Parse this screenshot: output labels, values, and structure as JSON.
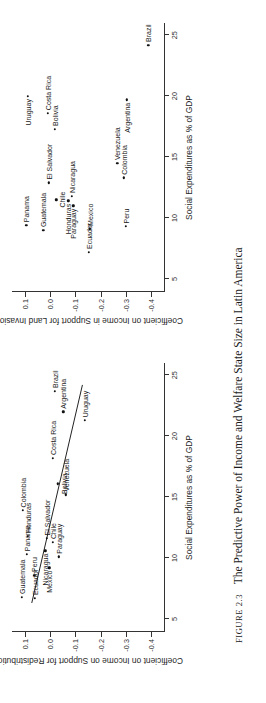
{
  "figure": {
    "number_label": "FIGURE 2.3",
    "caption": "The Predictive Power of Income and Welfare State Size in Latin America"
  },
  "chart_data": [
    {
      "type": "scatter",
      "panel": "left",
      "title": "",
      "xlabel": "Social Expenditures as % of GDP",
      "ylabel": "Coefficient on Income on Support for Redistribution",
      "xlim": [
        4,
        26
      ],
      "ylim": [
        -0.45,
        0.15
      ],
      "xticks": [
        "5",
        "10",
        "15",
        "20",
        "25"
      ],
      "xtick_values": [
        5,
        10,
        15,
        20,
        25
      ],
      "yticks": [
        "0.1",
        "0.0",
        "-0.1",
        "-0.2",
        "-0.3",
        "-0.4"
      ],
      "ytick_values": [
        0.1,
        0.0,
        -0.1,
        -0.2,
        -0.3,
        -0.4
      ],
      "grid": false,
      "legend": "none",
      "has_fit_line": true,
      "fit_line": {
        "x0": 6.3,
        "y0": 0.072,
        "x1": 24.2,
        "y1": -0.128
      },
      "points": [
        {
          "label": "Guatemala",
          "x": 6.8,
          "y": 0.112,
          "side": "lr"
        },
        {
          "label": "Colombia",
          "x": 13.9,
          "y": 0.108,
          "side": "lr"
        },
        {
          "label": "Panama",
          "x": 10.3,
          "y": 0.092,
          "side": "lr"
        },
        {
          "label": "Honduras",
          "x": 11.8,
          "y": 0.088,
          "side": "lr"
        },
        {
          "label": "Ecuador",
          "x": 6.7,
          "y": 0.059,
          "side": "lr"
        },
        {
          "label": "Peru",
          "x": 8.6,
          "y": 0.062,
          "side": "lr"
        },
        {
          "label": "Nicaragua",
          "x": 10.6,
          "y": 0.019,
          "side": "rl"
        },
        {
          "label": "El Salvador",
          "x": 11.6,
          "y": 0.012,
          "side": "lr"
        },
        {
          "label": "Mexico",
          "x": 9.2,
          "y": 0.002,
          "side": "rl"
        },
        {
          "label": "Chile",
          "x": 11.3,
          "y": -0.012,
          "side": "lr"
        },
        {
          "label": "Paraguay",
          "x": 10.1,
          "y": -0.035,
          "side": "lr"
        },
        {
          "label": "Bolivia",
          "x": 16.1,
          "y": -0.03,
          "side": "bt"
        },
        {
          "label": "Costa Rica",
          "x": 18.2,
          "y": -0.012,
          "side": "lr"
        },
        {
          "label": "Venezuela",
          "x": 15.2,
          "y": -0.062,
          "side": "lr"
        },
        {
          "label": "Argentina",
          "x": 22.0,
          "y": -0.052,
          "side": "lr"
        },
        {
          "label": "Brazil",
          "x": 23.7,
          "y": -0.02,
          "side": "lr"
        },
        {
          "label": "Uruguay",
          "x": 21.3,
          "y": -0.138,
          "side": "lr"
        }
      ]
    },
    {
      "type": "scatter",
      "panel": "right",
      "title": "",
      "xlabel": "Social Expenditures as % of GDP",
      "ylabel": "Coefficient on Income in Support for Land Invasions",
      "xlim": [
        4,
        26
      ],
      "ylim": [
        -0.45,
        0.15
      ],
      "xticks": [
        "5",
        "10",
        "15",
        "20",
        "25"
      ],
      "xtick_values": [
        5,
        10,
        15,
        20,
        25
      ],
      "yticks": [
        "0.1",
        "0.0",
        "-0.1",
        "-0.2",
        "-0.3",
        "-0.4"
      ],
      "ytick_values": [
        0.1,
        0.0,
        -0.1,
        -0.2,
        -0.3,
        -0.4
      ],
      "grid": false,
      "legend": "none",
      "has_fit_line": false,
      "points": [
        {
          "label": "Panama",
          "x": 9.4,
          "y": 0.094,
          "side": "lr"
        },
        {
          "label": "Uruguay",
          "x": 20.0,
          "y": 0.088,
          "side": "rl"
        },
        {
          "label": "Guatemala",
          "x": 9.0,
          "y": 0.026,
          "side": "lr"
        },
        {
          "label": "Costa Rica",
          "x": 18.6,
          "y": 0.008,
          "side": "lr"
        },
        {
          "label": "El Salvador",
          "x": 12.9,
          "y": 0.005,
          "side": "lr"
        },
        {
          "label": "Bolivia",
          "x": 17.3,
          "y": -0.018,
          "side": "lr"
        },
        {
          "label": "Chile",
          "x": 11.5,
          "y": -0.025,
          "side": "bt"
        },
        {
          "label": "Honduras",
          "x": 11.4,
          "y": -0.073,
          "side": "rl"
        },
        {
          "label": "Paraguay",
          "x": 11.0,
          "y": -0.092,
          "side": "rl"
        },
        {
          "label": "Nicaragua",
          "x": 11.8,
          "y": -0.086,
          "side": "lr"
        },
        {
          "label": "Ecuador",
          "x": 7.2,
          "y": -0.153,
          "side": "lr"
        },
        {
          "label": "Mexico",
          "x": 9.1,
          "y": -0.158,
          "side": "lr"
        },
        {
          "label": "Venezuela",
          "x": 14.5,
          "y": -0.265,
          "side": "lr"
        },
        {
          "label": "Colombia",
          "x": 13.3,
          "y": -0.292,
          "side": "lr"
        },
        {
          "label": "Peru",
          "x": 9.3,
          "y": -0.3,
          "side": "lr"
        },
        {
          "label": "Argentina",
          "x": 19.7,
          "y": -0.302,
          "side": "rl"
        },
        {
          "label": "Brazil",
          "x": 24.2,
          "y": -0.388,
          "side": "lr"
        }
      ]
    }
  ]
}
